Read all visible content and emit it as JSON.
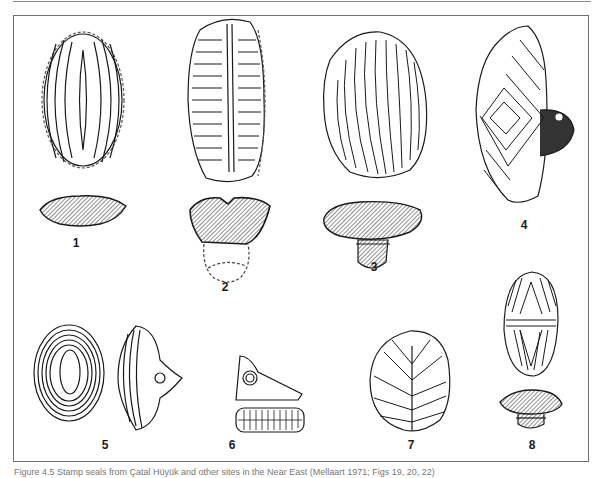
{
  "figure": {
    "labels": [
      {
        "id": "1",
        "x": 76,
        "y": 243
      },
      {
        "id": "2",
        "x": 225,
        "y": 287
      },
      {
        "id": "3",
        "x": 374,
        "y": 267
      },
      {
        "id": "4",
        "x": 524,
        "y": 225
      },
      {
        "id": "5",
        "x": 105,
        "y": 445
      },
      {
        "id": "6",
        "x": 232,
        "y": 445
      },
      {
        "id": "7",
        "x": 411,
        "y": 445
      },
      {
        "id": "8",
        "x": 532,
        "y": 445
      }
    ],
    "caption": "Figure 4.5 Stamp seals from Çatal Hüyük and other sites in the Near East (Mellaart 1971; Figs 19, 20, 22)"
  },
  "colors": {
    "ink": "#1a1a1a",
    "frame": "#6e6e6e",
    "caption": "#777777"
  }
}
